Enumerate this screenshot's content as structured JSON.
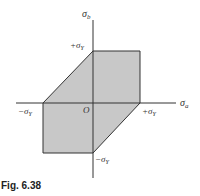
{
  "diagram": {
    "x_axis_label": "σ",
    "x_axis_sub": "a",
    "y_axis_label": "σ",
    "y_axis_sub": "b",
    "origin_label": "O",
    "labels": {
      "top": "+σ",
      "left": "−σ",
      "right": "+σ",
      "bottom": "−σ",
      "sub": "Y"
    },
    "fill_color": "#c8c8c8",
    "stroke_color": "#333333"
  },
  "caption": "Fig. 6.38"
}
